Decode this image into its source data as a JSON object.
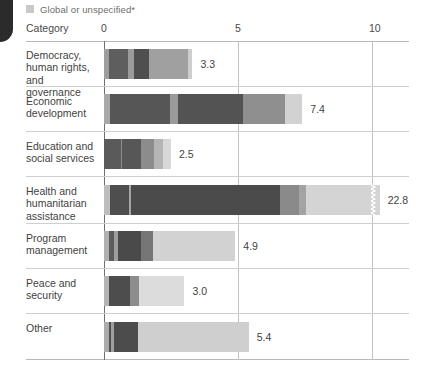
{
  "legend": {
    "swatch_name": "legend-swatch-global",
    "label": "Global or unspecified*",
    "color": "#c9c9c9"
  },
  "axis": {
    "category_header": "Category",
    "ticks": [
      "0",
      "5",
      "10"
    ]
  },
  "chart_data": {
    "type": "bar",
    "orientation": "horizontal",
    "stacked": true,
    "title": "",
    "subtitle": "",
    "xlabel": "",
    "ylabel": "Category",
    "xlim": [
      0,
      10
    ],
    "xticks": [
      0,
      5,
      10
    ],
    "grid": true,
    "legend_position": "top-left",
    "legend_entries": [
      "Global or unspecified*"
    ],
    "note": "Health and humanitarian assistance bar is truncated with an axis-break marker",
    "categories": [
      "Democracy, human rights, and governance",
      "Economic development",
      "Education and social services",
      "Health and humanitarian assistance",
      "Program management",
      "Peace and security",
      "Other"
    ],
    "values": [
      3.3,
      7.4,
      2.5,
      22.8,
      4.9,
      3.0,
      5.4
    ],
    "value_labels": [
      "3.3",
      "7.4",
      "2.5",
      "22.8",
      "4.9",
      "3.0",
      "5.4"
    ],
    "bars": [
      {
        "category": "Democracy, human rights, and governance",
        "total": 3.3,
        "label": "3.3",
        "truncated": false,
        "segments": [
          {
            "value": 0.18,
            "color": "#9e9e9e"
          },
          {
            "value": 0.72,
            "color": "#5e5e5e"
          },
          {
            "value": 0.22,
            "color": "#9b9b9b"
          },
          {
            "value": 0.55,
            "color": "#4f4f4f"
          },
          {
            "value": 1.45,
            "color": "#a0a0a0"
          },
          {
            "value": 0.18,
            "color": "#cdcdcd"
          }
        ]
      },
      {
        "category": "Economic development",
        "total": 7.4,
        "label": "7.4",
        "truncated": false,
        "segments": [
          {
            "value": 0.22,
            "color": "#a8a8a8"
          },
          {
            "value": 2.25,
            "color": "#565656"
          },
          {
            "value": 0.28,
            "color": "#9a9a9a"
          },
          {
            "value": 2.45,
            "color": "#535353"
          },
          {
            "value": 1.55,
            "color": "#8f8f8f"
          },
          {
            "value": 0.65,
            "color": "#d2d2d2"
          }
        ]
      },
      {
        "category": "Education and social services",
        "total": 2.5,
        "label": "2.5",
        "truncated": false,
        "segments": [
          {
            "value": 0.62,
            "color": "#5a5a5a"
          },
          {
            "value": 0.06,
            "color": "#8e8e8e"
          },
          {
            "value": 0.72,
            "color": "#575757"
          },
          {
            "value": 0.48,
            "color": "#8c8c8c"
          },
          {
            "value": 0.32,
            "color": "#b5b5b5"
          },
          {
            "value": 0.3,
            "color": "#d8d8d8"
          }
        ]
      },
      {
        "category": "Health and humanitarian assistance",
        "total": 22.8,
        "label": "22.8",
        "truncated": true,
        "segments": [
          {
            "value": 0.22,
            "color": "#bdbdbd"
          },
          {
            "value": 0.7,
            "color": "#4e4e4e"
          },
          {
            "value": 0.1,
            "color": "#a5a5a5"
          },
          {
            "value": 5.55,
            "color": "#4b4b4b"
          },
          {
            "value": 0.7,
            "color": "#8a8a8a"
          },
          {
            "value": 0.28,
            "color": "#a3a3a3"
          },
          {
            "value": 2.4,
            "color": "#d4d4d4"
          }
        ]
      },
      {
        "category": "Program management",
        "total": 4.9,
        "label": "4.9",
        "truncated": false,
        "segments": [
          {
            "value": 0.2,
            "color": "#b0b0b0"
          },
          {
            "value": 0.18,
            "color": "#5c5c5c"
          },
          {
            "value": 0.14,
            "color": "#9d9d9d"
          },
          {
            "value": 0.85,
            "color": "#4a4a4a"
          },
          {
            "value": 0.45,
            "color": "#767676"
          },
          {
            "value": 3.08,
            "color": "#d2d2d2"
          }
        ]
      },
      {
        "category": "Peace and security",
        "total": 3.0,
        "label": "3.0",
        "truncated": false,
        "segments": [
          {
            "value": 0.18,
            "color": "#b4b4b4"
          },
          {
            "value": 0.78,
            "color": "#4d4d4d"
          },
          {
            "value": 0.34,
            "color": "#8d8d8d"
          },
          {
            "value": 1.7,
            "color": "#dcdcdc"
          }
        ]
      },
      {
        "category": "Other",
        "total": 5.4,
        "label": "5.4",
        "truncated": false,
        "segments": [
          {
            "value": 0.18,
            "color": "#acacac"
          },
          {
            "value": 0.1,
            "color": "#4f4f4f"
          },
          {
            "value": 0.1,
            "color": "#9f9f9f"
          },
          {
            "value": 0.9,
            "color": "#4c4c4c"
          },
          {
            "value": 4.12,
            "color": "#cfcfcf"
          }
        ]
      }
    ]
  }
}
